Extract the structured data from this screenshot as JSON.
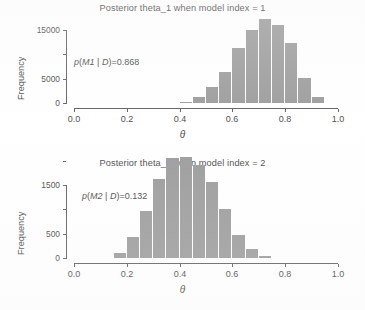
{
  "figure": {
    "background": "#ffffff",
    "bar_color": "#8e8e8e",
    "axis_color": "#4a4a4a",
    "text_color": "#2f2f2f"
  },
  "chart_data": [
    {
      "type": "bar",
      "id": "posterior-theta-1",
      "title": "Posterior theta_1 when model index = 1",
      "xlabel": "θ",
      "ylabel": "Frequency",
      "annotation": "p(M1 | D) = 0.868",
      "annotation_parts": {
        "p": "p",
        "open": "(",
        "model": "M1",
        "bar": " | ",
        "data": "D",
        "close": ")",
        "equals": "=",
        "value": "0.868"
      },
      "xlim": [
        0.0,
        1.0
      ],
      "ylim": [
        0,
        17500
      ],
      "xticks": [
        0.0,
        0.2,
        0.4,
        0.6,
        0.8,
        1.0
      ],
      "xticklabels": [
        "0.0",
        "0.2",
        "0.4",
        "0.6",
        "0.8",
        "1.0"
      ],
      "yticks": [
        0,
        5000,
        10000,
        15000
      ],
      "yticklabels": [
        "0",
        "5000",
        "",
        "15000"
      ],
      "grid": false,
      "legend": "none",
      "bin_width": 0.05,
      "bin_edges": [
        0.4,
        0.45,
        0.5,
        0.55,
        0.6,
        0.65,
        0.7,
        0.75,
        0.8,
        0.85,
        0.9,
        0.95
      ],
      "categories": [
        "0.40-0.45",
        "0.45-0.50",
        "0.50-0.55",
        "0.55-0.60",
        "0.60-0.65",
        "0.65-0.70",
        "0.70-0.75",
        "0.75-0.80",
        "0.80-0.85",
        "0.85-0.90",
        "0.90-0.95"
      ],
      "values": [
        200,
        1200,
        3300,
        6400,
        11200,
        15100,
        17200,
        16100,
        12300,
        5200,
        1300
      ]
    },
    {
      "type": "bar",
      "id": "posterior-theta-2",
      "title": "Posterior theta_2 when model index = 2",
      "xlabel": "θ",
      "ylabel": "Frequency",
      "annotation": "p(M2 | D) = 0.132",
      "annotation_parts": {
        "p": "p",
        "open": "(",
        "model": "M2",
        "bar": " | ",
        "data": "D",
        "close": ")",
        "equals": "=",
        "value": "0.132"
      },
      "xlim": [
        0.0,
        1.0
      ],
      "ylim": [
        0,
        2150
      ],
      "xticks": [
        0.0,
        0.2,
        0.4,
        0.6,
        0.8,
        1.0
      ],
      "xticklabels": [
        "0.0",
        "0.2",
        "0.4",
        "0.6",
        "0.8",
        "1.0"
      ],
      "yticks": [
        0,
        500,
        1000,
        1500,
        2000
      ],
      "yticklabels": [
        "0",
        "500",
        "",
        "1500",
        ""
      ],
      "grid": false,
      "legend": "none",
      "bin_width": 0.05,
      "bin_edges": [
        0.15,
        0.2,
        0.25,
        0.3,
        0.35,
        0.4,
        0.45,
        0.5,
        0.55,
        0.6,
        0.65,
        0.7,
        0.75
      ],
      "categories": [
        "0.15-0.20",
        "0.20-0.25",
        "0.25-0.30",
        "0.30-0.35",
        "0.35-0.40",
        "0.40-0.45",
        "0.45-0.50",
        "0.50-0.55",
        "0.55-0.60",
        "0.60-0.65",
        "0.65-0.70",
        "0.70-0.75"
      ],
      "values": [
        110,
        440,
        960,
        1630,
        2060,
        2070,
        1920,
        1560,
        1000,
        480,
        195,
        45
      ]
    }
  ]
}
